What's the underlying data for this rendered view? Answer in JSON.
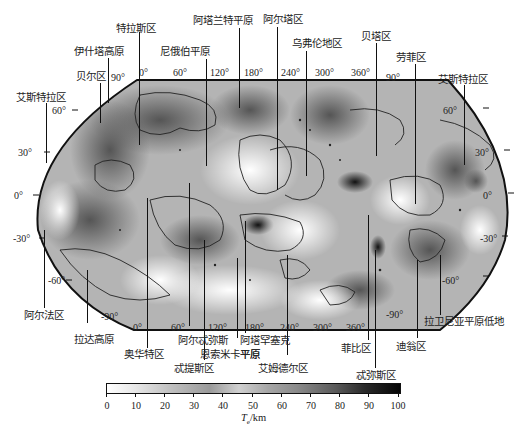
{
  "map": {
    "projection": "Robinson-like global projection",
    "top_longitude_ticks": [
      "0°",
      "60°",
      "120°",
      "180°",
      "240°",
      "300°",
      "360°"
    ],
    "bottom_longitude_ticks": [
      "0°",
      "60°",
      "120°",
      "180°",
      "240°",
      "300°",
      "360°"
    ],
    "left_latitude_ticks": [
      "90°",
      "60°",
      "30°",
      "0°",
      "-30°",
      "-60°",
      "-90°"
    ],
    "right_latitude_ticks": [
      "90°",
      "60°",
      "30°",
      "0°",
      "-30°",
      "-60°",
      "-90°"
    ],
    "regions_top": [
      {
        "name": "阿塔兰特平原"
      },
      {
        "name": "阿尔塔区"
      },
      {
        "name": "乌弗伦地区"
      },
      {
        "name": "特拉斯区"
      },
      {
        "name": "贝塔区"
      },
      {
        "name": "伊什塔高原"
      },
      {
        "name": "尼俄伯平原"
      },
      {
        "name": "劳菲区"
      },
      {
        "name": "贝尔区"
      },
      {
        "name": "艾斯特拉区 (left)"
      },
      {
        "name": "艾斯特拉区 (right)"
      }
    ],
    "regions_bottom": [
      {
        "name": "阿尔法区"
      },
      {
        "name": "拉达高原"
      },
      {
        "name": "奥华特区"
      },
      {
        "name": "阿尔忒弥斯"
      },
      {
        "name": "忒提斯区"
      },
      {
        "name": "恩索米卡平原"
      },
      {
        "name": "阿塔罕塞克平原"
      },
      {
        "name": "艾姆德尔区"
      },
      {
        "name": "菲比区"
      },
      {
        "name": "忒弥斯区"
      },
      {
        "name": "迪翁区"
      },
      {
        "name": "拉卫尼亚平原低地"
      }
    ],
    "labels": {
      "atalanta": "阿塔兰特平原",
      "alta": "阿尔塔区",
      "ulfrun": "乌弗伦地区",
      "tellus": "特拉斯区",
      "beta": "贝塔区",
      "ishtar": "伊什塔高原",
      "niobe": "尼俄伯平原",
      "laufey": "劳菲区",
      "bell": "贝尔区",
      "eistla_left": "艾斯特拉区",
      "eistla_right": "艾斯特拉区",
      "alpha": "阿尔法区",
      "lada": "拉达高原",
      "ovda": "奥华特区",
      "artemis": "阿尔忒弥斯",
      "thetis": "忒提斯区",
      "aino": "恩索米卡平原",
      "atahensik": "阿塔罕塞克",
      "atahensik2": "平原",
      "imdr": "艾姆德尔区",
      "phoebe": "菲比区",
      "themis": "忒弥斯区",
      "dione": "迪翁区",
      "lavinia": "拉卫尼亚平原低地"
    }
  },
  "colorbar": {
    "ticks": [
      "0",
      "10",
      "20",
      "30",
      "40",
      "50",
      "60",
      "70",
      "80",
      "90",
      "100"
    ],
    "title_var": "T",
    "title_sub": "e",
    "title_unit": "/km",
    "range": [
      0,
      100
    ]
  }
}
